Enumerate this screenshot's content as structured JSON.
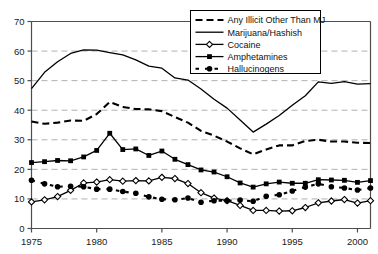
{
  "chart_data": {
    "type": "line",
    "title": "",
    "subtitle": "",
    "xlabel": "",
    "ylabel": "",
    "xlim": [
      1975,
      2001
    ],
    "ylim": [
      0,
      70
    ],
    "grid": true,
    "grid_axis": "y",
    "legend_position": "top-right",
    "x_ticks": [
      "1975",
      "1980",
      "1985",
      "1990",
      "1995",
      "2000"
    ],
    "x_tick_values": [
      1975,
      1980,
      1985,
      1990,
      1995,
      2000
    ],
    "y_ticks": [
      "0",
      "10",
      "20",
      "30",
      "40",
      "50",
      "60",
      "70"
    ],
    "y_tick_values": [
      0,
      10,
      20,
      30,
      40,
      50,
      60,
      70
    ],
    "x": [
      1975,
      1976,
      1977,
      1978,
      1979,
      1980,
      1981,
      1982,
      1983,
      1984,
      1985,
      1986,
      1987,
      1988,
      1989,
      1990,
      1991,
      1992,
      1993,
      1994,
      1995,
      1996,
      1997,
      1998,
      1999,
      2000,
      2001
    ],
    "series": [
      {
        "name": "Any Illicit Other Than MJ",
        "style": "dashed",
        "marker": "none",
        "color": "#000000",
        "values": [
          36.2,
          35.4,
          35.8,
          36.5,
          36.4,
          38.7,
          42.8,
          41.1,
          40.4,
          40.3,
          39.7,
          37.7,
          35.8,
          33.0,
          31.4,
          29.4,
          27.1,
          25.1,
          26.7,
          28.1,
          28.1,
          29.6,
          30.0,
          29.4,
          29.4,
          29.0,
          28.9
        ]
      },
      {
        "name": "Marijuana/Hashish",
        "style": "solid",
        "marker": "none",
        "color": "#000000",
        "values": [
          47.3,
          52.8,
          56.4,
          59.2,
          60.4,
          60.3,
          59.5,
          58.7,
          57.0,
          54.9,
          54.2,
          50.9,
          50.2,
          47.2,
          43.7,
          40.7,
          36.7,
          32.6,
          35.3,
          38.2,
          41.7,
          44.9,
          49.6,
          49.1,
          49.7,
          48.8,
          49.0
        ]
      },
      {
        "name": "Cocaine",
        "style": "solid",
        "marker": "open-diamond",
        "color": "#000000",
        "values": [
          9.0,
          9.7,
          10.8,
          12.9,
          15.4,
          15.7,
          16.5,
          16.0,
          16.2,
          16.1,
          17.3,
          16.9,
          15.2,
          12.1,
          10.3,
          9.4,
          7.8,
          6.1,
          6.1,
          5.9,
          6.0,
          7.1,
          8.7,
          9.3,
          9.8,
          8.6,
          9.4
        ]
      },
      {
        "name": "Amphetamines",
        "style": "solid",
        "marker": "filled-square",
        "color": "#000000",
        "values": [
          22.3,
          22.6,
          23.0,
          22.9,
          24.2,
          26.4,
          32.2,
          26.7,
          26.9,
          24.7,
          26.2,
          23.4,
          21.6,
          19.8,
          19.1,
          17.5,
          15.4,
          14.0,
          15.1,
          15.7,
          15.3,
          15.3,
          16.5,
          16.4,
          16.3,
          15.6,
          16.2
        ]
      },
      {
        "name": "Hallucinogens",
        "style": "dashed",
        "marker": "filled-circle",
        "color": "#000000",
        "values": [
          16.3,
          15.1,
          14.1,
          14.3,
          14.1,
          13.3,
          13.3,
          12.5,
          11.9,
          10.7,
          9.9,
          9.7,
          10.3,
          8.9,
          9.4,
          9.4,
          9.6,
          9.2,
          10.9,
          11.4,
          12.7,
          14.0,
          15.1,
          14.1,
          13.7,
          13.0,
          13.7
        ]
      }
    ],
    "legend": [
      {
        "label": "Any Illicit Other Than MJ",
        "style": "dashed",
        "marker": "none"
      },
      {
        "label": "Marijuana/Hashish",
        "style": "solid",
        "marker": "none"
      },
      {
        "label": "Cocaine",
        "style": "solid",
        "marker": "open-diamond"
      },
      {
        "label": "Amphetamines",
        "style": "solid",
        "marker": "filled-square"
      },
      {
        "label": "Hallucinogens",
        "style": "dashed",
        "marker": "filled-circle"
      }
    ],
    "colors": {
      "line": "#000000",
      "grid": "#b0b0b0",
      "axis": "#4d4d4d",
      "background": "#ffffff"
    }
  }
}
